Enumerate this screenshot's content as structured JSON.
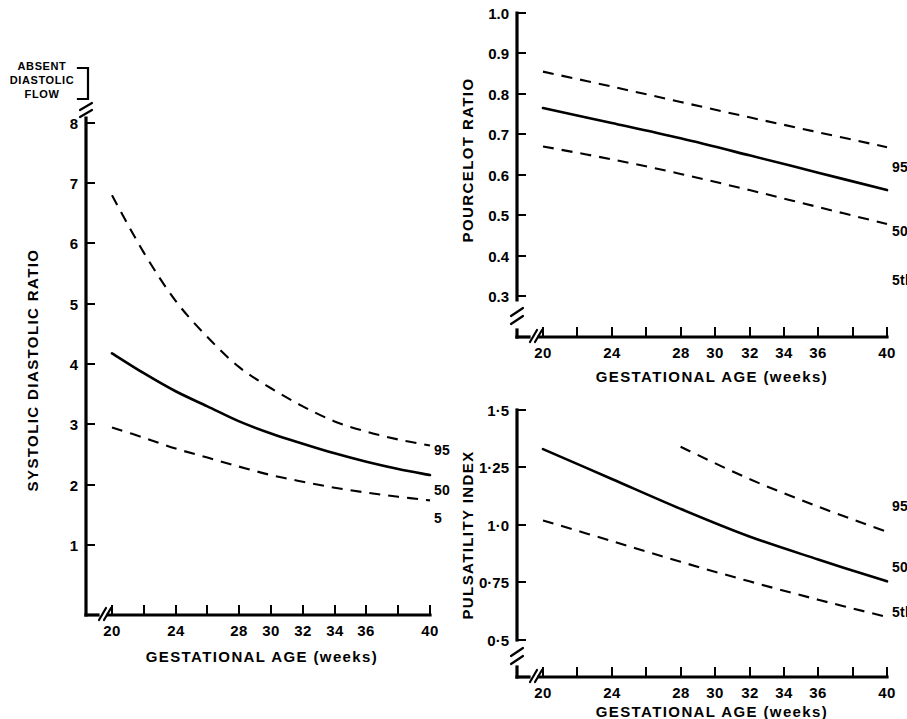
{
  "figure": {
    "panels": [
      {
        "id": "systolic-diastolic-ratio",
        "ylabel": "SYSTOLIC DIASTOLIC RATIO",
        "xlabel": "GESTATIONAL AGE (weeks)",
        "note": "ABSENT\nDIASTOLIC\nFLOW",
        "note_line1": "ABSENT",
        "note_line2": "DIASTOLIC",
        "note_line3": "FLOW",
        "curve_labels": {
          "p95": "95",
          "p50": "50",
          "p5": "5"
        }
      },
      {
        "id": "pourcelot-ratio",
        "ylabel": "POURCELOT RATIO",
        "xlabel": "GESTATIONAL AGE (weeks)",
        "curve_labels": {
          "p95": "95th",
          "p50": "50th",
          "p5": "5th"
        }
      },
      {
        "id": "pulsatility-index",
        "ylabel": "PULSATILITY INDEX",
        "xlabel": "GESTATIONAL AGE (weeks)",
        "curve_labels": {
          "p95": "95th",
          "p50": "50th",
          "p5": "5th"
        }
      }
    ]
  },
  "chart_data": [
    {
      "type": "line",
      "id": "systolic-diastolic-ratio",
      "title": "",
      "xlabel": "GESTATIONAL AGE (weeks)",
      "ylabel": "SYSTOLIC DIASTOLIC RATIO",
      "xlim": [
        20,
        40
      ],
      "ylim": [
        0,
        8
      ],
      "xticks": [
        20,
        22,
        24,
        26,
        28,
        30,
        32,
        34,
        36,
        38,
        40
      ],
      "xticklabels": [
        "20",
        "",
        "24",
        "",
        "28",
        "30",
        "32",
        "34",
        "36",
        "",
        "40"
      ],
      "yticks": [
        1,
        2,
        3,
        4,
        5,
        6,
        7,
        8
      ],
      "yticklabels": [
        "1",
        "2",
        "3",
        "4",
        "5",
        "6",
        "7",
        "8"
      ],
      "axis_break_x": true,
      "axis_break_y": true,
      "grid": false,
      "annotations": [
        "ABSENT DIASTOLIC FLOW"
      ],
      "x": [
        20,
        22,
        24,
        26,
        28,
        30,
        32,
        34,
        36,
        38,
        40
      ],
      "series": [
        {
          "name": "95",
          "style": "dashed",
          "values": [
            6.8,
            5.85,
            5.05,
            4.45,
            3.95,
            3.6,
            3.3,
            3.05,
            2.88,
            2.75,
            2.65
          ]
        },
        {
          "name": "50",
          "style": "solid",
          "values": [
            4.18,
            3.85,
            3.55,
            3.3,
            3.05,
            2.85,
            2.68,
            2.52,
            2.38,
            2.26,
            2.16
          ]
        },
        {
          "name": "5",
          "style": "dashed",
          "values": [
            2.95,
            2.78,
            2.6,
            2.45,
            2.3,
            2.16,
            2.05,
            1.95,
            1.87,
            1.8,
            1.74
          ]
        }
      ]
    },
    {
      "type": "line",
      "id": "pourcelot-ratio",
      "title": "",
      "xlabel": "GESTATIONAL AGE (weeks)",
      "ylabel": "POURCELOT RATIO",
      "xlim": [
        20,
        40
      ],
      "ylim": [
        0.3,
        1.0
      ],
      "xticks": [
        20,
        22,
        24,
        26,
        28,
        30,
        32,
        34,
        36,
        38,
        40
      ],
      "xticklabels": [
        "20",
        "",
        "24",
        "",
        "28",
        "30",
        "32",
        "34",
        "36",
        "",
        "40"
      ],
      "yticks": [
        0.3,
        0.4,
        0.5,
        0.6,
        0.7,
        0.8,
        0.9,
        1.0
      ],
      "yticklabels": [
        "0.3",
        "0.4",
        "0.5",
        "0.6",
        "0.7",
        "0.8",
        "0.9",
        "1.0"
      ],
      "axis_break_x": true,
      "axis_break_y": true,
      "grid": false,
      "x": [
        20,
        24,
        28,
        32,
        36,
        40
      ],
      "series": [
        {
          "name": "95th",
          "style": "dashed",
          "values": [
            0.855,
            0.818,
            0.78,
            0.742,
            0.705,
            0.668
          ]
        },
        {
          "name": "50th",
          "style": "solid",
          "values": [
            0.765,
            0.728,
            0.69,
            0.648,
            0.605,
            0.562
          ]
        },
        {
          "name": "5th",
          "style": "dashed",
          "values": [
            0.67,
            0.638,
            0.602,
            0.562,
            0.52,
            0.478
          ]
        }
      ]
    },
    {
      "type": "line",
      "id": "pulsatility-index",
      "title": "",
      "xlabel": "GESTATIONAL AGE (weeks)",
      "ylabel": "PULSATILITY INDEX",
      "xlim": [
        20,
        40
      ],
      "ylim": [
        0.5,
        1.5
      ],
      "xticks": [
        20,
        22,
        24,
        26,
        28,
        30,
        32,
        34,
        36,
        38,
        40
      ],
      "xticklabels": [
        "20",
        "",
        "24",
        "",
        "28",
        "30",
        "32",
        "34",
        "36",
        "",
        "40"
      ],
      "yticks": [
        0.5,
        0.75,
        1.0,
        1.25,
        1.5
      ],
      "yticklabels": [
        "0·5",
        "0·75",
        "1·0",
        "1·25",
        "1·5"
      ],
      "axis_break_x": true,
      "axis_break_y": true,
      "grid": false,
      "series": [
        {
          "name": "95th",
          "style": "dashed",
          "x": [
            28,
            32,
            36,
            40
          ],
          "values": [
            1.34,
            1.2,
            1.08,
            0.97
          ]
        },
        {
          "name": "50th",
          "style": "solid",
          "x": [
            20,
            24,
            28,
            32,
            36,
            40
          ],
          "values": [
            1.33,
            1.2,
            1.07,
            0.95,
            0.85,
            0.755
          ]
        },
        {
          "name": "5th",
          "style": "dashed",
          "x": [
            20,
            24,
            28,
            32,
            36,
            40
          ],
          "values": [
            1.02,
            0.93,
            0.84,
            0.755,
            0.675,
            0.6
          ]
        }
      ]
    }
  ]
}
